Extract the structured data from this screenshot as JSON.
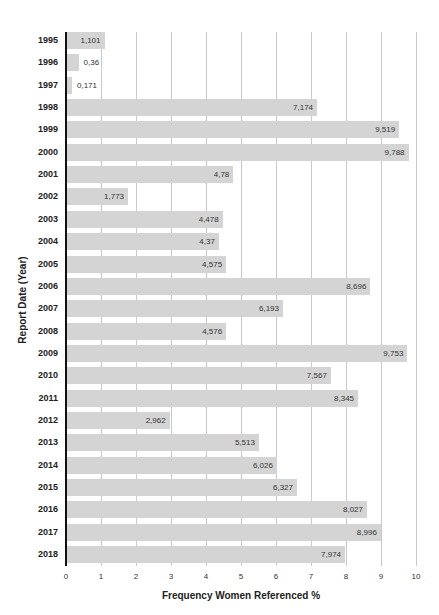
{
  "chart_data": {
    "type": "bar",
    "orientation": "horizontal",
    "title": "",
    "xlabel": "Frequency Women Referenced %",
    "ylabel": "Report Date (Year)",
    "xlim": [
      0,
      10
    ],
    "x_ticks": [
      "0",
      "1",
      "2",
      "3",
      "4",
      "5",
      "6",
      "7",
      "8",
      "9",
      "10"
    ],
    "grid": "vertical gridlines at each integer",
    "legend": "none",
    "bar_color": "#d4d4d4",
    "categories": [
      "1995",
      "1996",
      "1997",
      "1998",
      "1999",
      "2000",
      "2001",
      "2002",
      "2003",
      "2004",
      "2005",
      "2006",
      "2007",
      "2008",
      "2009",
      "2010",
      "2011",
      "2012",
      "2013",
      "2014",
      "2015",
      "2016",
      "2017",
      "2018"
    ],
    "values": [
      1.101,
      0.36,
      0.171,
      7.174,
      9.519,
      9.788,
      4.78,
      1.773,
      4.478,
      4.37,
      4.575,
      8.696,
      6.193,
      4.576,
      9.753,
      7.567,
      8.345,
      2.962,
      5.513,
      6.026,
      6.327,
      8.027,
      8.996,
      7.974
    ],
    "value_labels": [
      "1,101",
      "0,36",
      "0,171",
      "7,174",
      "9,519",
      "9,788",
      "4,78",
      "1,773",
      "4,478",
      "4,37",
      "4,575",
      "8,696",
      "6,193",
      "4,576",
      "9,753",
      "7,567",
      "8,345",
      "2,962",
      "5,513",
      "6,026",
      "6,327",
      "8,027",
      "8,996",
      "7,974"
    ],
    "bar_extent_estimates": {
      "2007": 6.2,
      "2015": 6.6,
      "2016": 8.6
    }
  }
}
